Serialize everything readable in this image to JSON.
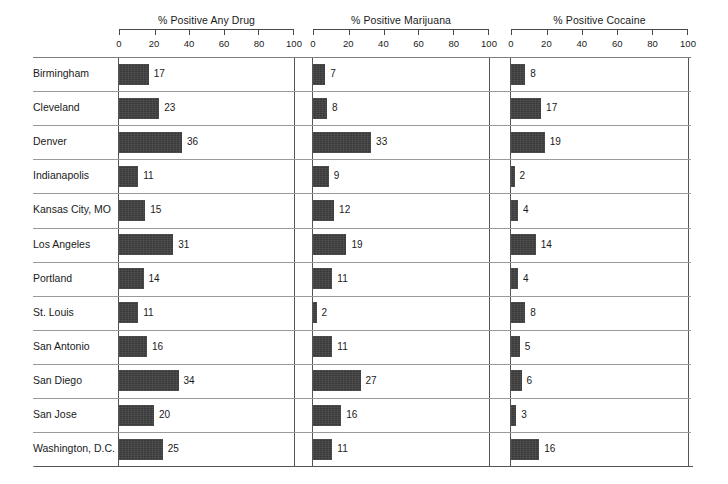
{
  "chart_data": {
    "type": "bar",
    "title": "",
    "orientation": "horizontal",
    "layout": "small-multiples",
    "grid": true,
    "legend": "none",
    "xlabel": "",
    "ylabel": "",
    "xlim": [
      0,
      100
    ],
    "xticks": [
      0,
      20,
      40,
      60,
      80,
      100
    ],
    "categories": [
      "Birmingham",
      "Cleveland",
      "Denver",
      "Indianapolis",
      "Kansas City, MO",
      "Los Angeles",
      "Portland",
      "St. Louis",
      "San Antonio",
      "San Diego",
      "San Jose",
      "Washington, D.C."
    ],
    "series": [
      {
        "name": "% Positive Any Drug",
        "values": [
          17,
          23,
          36,
          11,
          15,
          31,
          14,
          11,
          16,
          34,
          20,
          25
        ]
      },
      {
        "name": "% Positive Marijuana",
        "values": [
          7,
          8,
          33,
          9,
          12,
          19,
          11,
          2,
          11,
          27,
          16,
          11
        ]
      },
      {
        "name": "% Positive Cocaine",
        "values": [
          8,
          17,
          19,
          2,
          4,
          14,
          4,
          8,
          5,
          6,
          3,
          16
        ]
      }
    ],
    "colors": {
      "bar": "#3a3a3a",
      "axis": "#555555",
      "gridline": "#7d7d7d",
      "text": "#1a1a1a",
      "background": "#ffffff"
    }
  }
}
